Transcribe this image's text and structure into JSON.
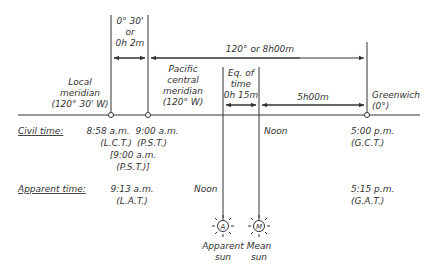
{
  "diagram": {
    "offset_label": [
      "0° 30'",
      "or",
      "0h 2m"
    ],
    "span_label": "120° or 8h00m",
    "local_meridian": [
      "Local",
      "meridian",
      "(120° 30' W)"
    ],
    "pacific_meridian": [
      "Pacific",
      "central",
      "meridian",
      "(120° W)"
    ],
    "eq_of_time": [
      "Eq. of",
      "time",
      "0h 15m"
    ],
    "mean_to_greenwich": "5h00m",
    "greenwich": [
      "Greenwich",
      "(0°)"
    ],
    "rows": {
      "civil": {
        "label": "Civil time:",
        "local": [
          "8:58 a.m.",
          "(L.C.T.)"
        ],
        "pacific": [
          "9:00 a.m.",
          "(P.S.T.)"
        ],
        "pacific_bracket": [
          "[9:00 a.m.",
          "(P.S.T.)]"
        ],
        "mean_sun": "Noon",
        "greenwich": [
          "5:00 p.m.",
          "(G.C.T.)"
        ]
      },
      "apparent": {
        "label": "Apparent time:",
        "local": [
          "9:13 a.m.",
          "(L.A.T.)"
        ],
        "apparent_sun": "Noon",
        "greenwich": [
          "5:15 p.m.",
          "(G.A.T.)"
        ]
      }
    },
    "suns": {
      "apparent": {
        "symbol": "A",
        "label": [
          "Apparent",
          "sun"
        ]
      },
      "mean": {
        "symbol": "M",
        "label": [
          "Mean",
          "sun"
        ]
      }
    }
  }
}
